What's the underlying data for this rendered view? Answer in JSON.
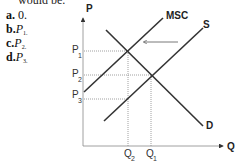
{
  "question": {
    "partial_text": "would be."
  },
  "options": [
    {
      "letter": "a.",
      "value": "0."
    },
    {
      "letter": "b.",
      "value": "P",
      "sub": "1."
    },
    {
      "letter": "c.",
      "value": "P",
      "sub": "2."
    },
    {
      "letter": "d.",
      "value": "P",
      "sub": "3."
    }
  ],
  "diagram": {
    "y_axis_label": "P",
    "x_axis_label": "Q",
    "curves": {
      "msc": "MSC",
      "s": "S",
      "d": "D"
    },
    "price_labels": [
      {
        "main": "P",
        "sub": "1"
      },
      {
        "main": "P",
        "sub": "2"
      },
      {
        "main": "P",
        "sub": "3"
      }
    ],
    "quantity_labels": [
      {
        "main": "Q",
        "sub": "2"
      },
      {
        "main": "Q",
        "sub": "1"
      }
    ],
    "colors": {
      "line": "#333333",
      "dotted": "#888888",
      "arrow": "#555555"
    }
  }
}
